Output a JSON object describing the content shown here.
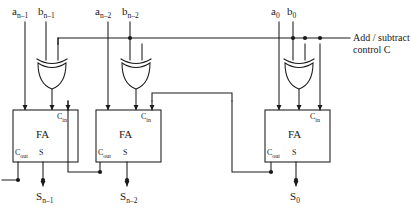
{
  "diagram": {
    "line_color": "#1a1a1a",
    "fill_color": "#ffffff"
  },
  "control": {
    "line1": "Add / subtract",
    "line2": "control C"
  },
  "stages": [
    {
      "id": "stage-n-1",
      "a_label": "a",
      "a_sub": "n–1",
      "b_label": "b",
      "b_sub": "n–1",
      "sum_label": "S",
      "sum_sub": "n–1",
      "fa_label": "FA",
      "cin_label": "C",
      "cin_sub": "in",
      "cout_label": "C",
      "cout_sub": "out",
      "s_pin_label": "S"
    },
    {
      "id": "stage-n-2",
      "a_label": "a",
      "a_sub": "n–2",
      "b_label": "b",
      "b_sub": "n–2",
      "sum_label": "S",
      "sum_sub": "n–2",
      "fa_label": "FA",
      "cin_label": "C",
      "cin_sub": "in",
      "cout_label": "C",
      "cout_sub": "out",
      "s_pin_label": "S"
    },
    {
      "id": "stage-0",
      "a_label": "a",
      "a_sub": "0",
      "b_label": "b",
      "b_sub": "0",
      "sum_label": "S",
      "sum_sub": "0",
      "fa_label": "FA",
      "cin_label": "C",
      "cin_sub": "in",
      "cout_label": "C",
      "cout_sub": "out",
      "s_pin_label": "S"
    }
  ],
  "gates": [
    {
      "name": "xor-gate-n-1"
    },
    {
      "name": "xor-gate-n-2"
    },
    {
      "name": "xor-gate-0"
    }
  ]
}
